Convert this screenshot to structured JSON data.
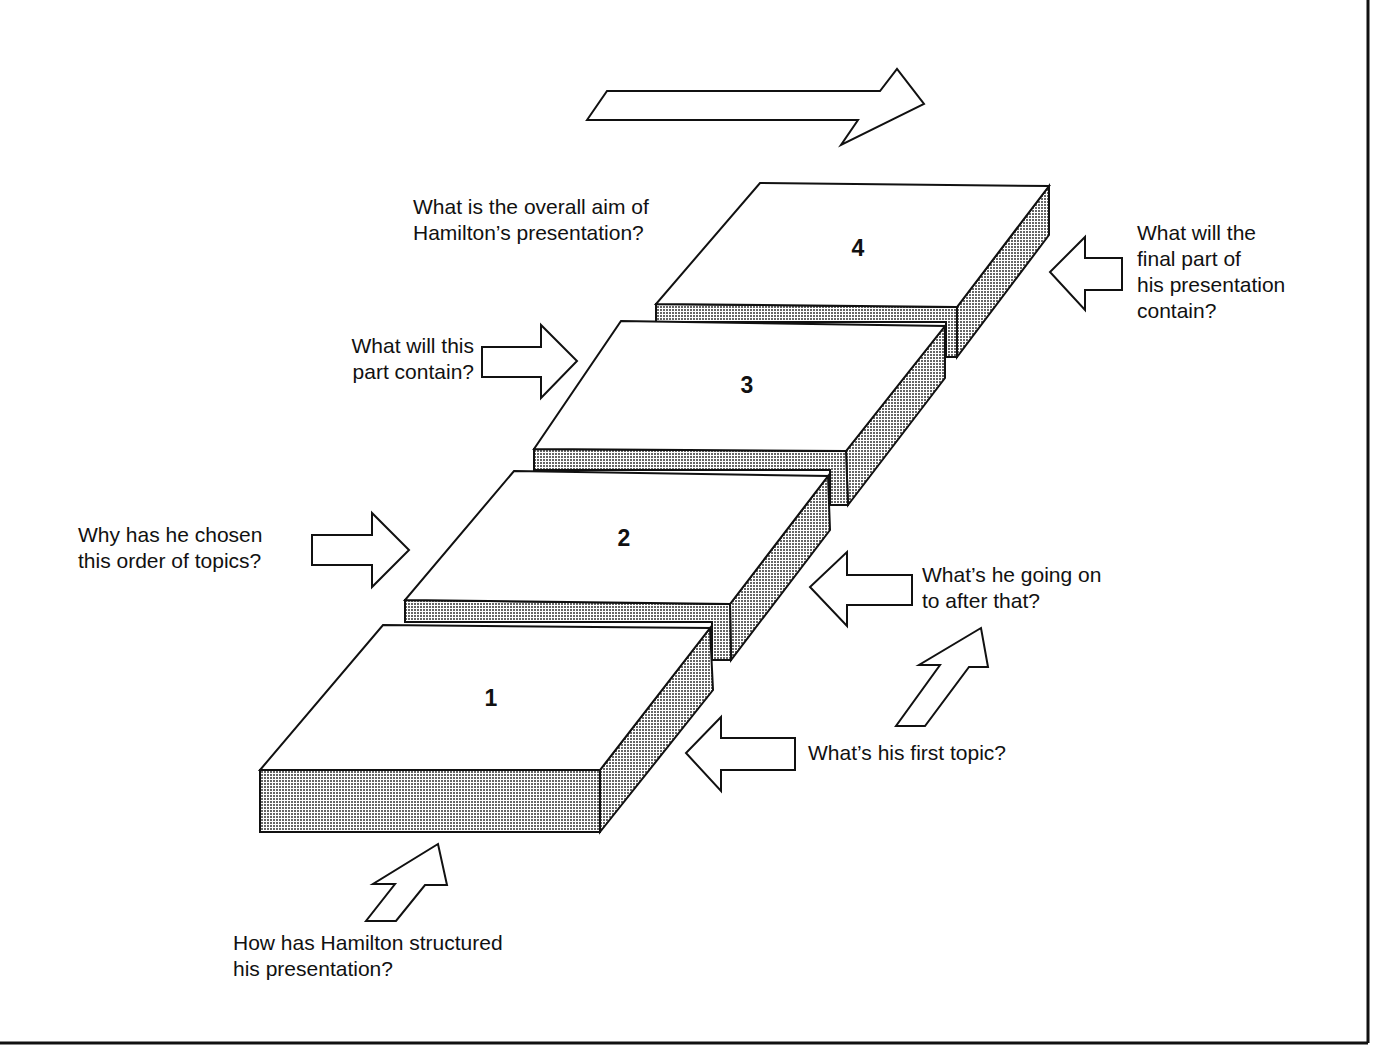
{
  "diagram": {
    "title_arrow": {
      "direction": "right"
    },
    "blocks": [
      {
        "id": "1",
        "label": "1"
      },
      {
        "id": "2",
        "label": "2"
      },
      {
        "id": "3",
        "label": "3"
      },
      {
        "id": "4",
        "label": "4"
      }
    ],
    "questions": {
      "overall_aim": "What is the overall aim of\nHamilton’s presentation?",
      "part_contain": "What will this\npart contain?",
      "order_topics": "Why has he chosen\nthis order of topics?",
      "final_part": "What will the\nfinal part of\nhis presentation\ncontain?",
      "going_on": "What’s he going on\nto after that?",
      "first_topic": "What’s his first topic?",
      "structured": "How has Hamilton structured\nhis presentation?"
    },
    "colors": {
      "line": "#111111",
      "fill": "#ffffff",
      "shade_dot": "#555555"
    }
  }
}
